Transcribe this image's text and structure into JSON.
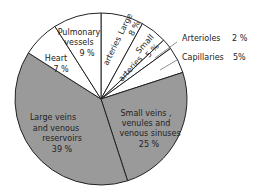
{
  "chart_data": {
    "type": "pie",
    "title": "",
    "start_angle_deg": 0,
    "direction": "clockwise",
    "categories": [
      "Large arteries",
      "Small arteries",
      "Arterioles",
      "Capillaries",
      "Small veins, venules and venous sinuses",
      "Large veins and venous reservoirs",
      "Heart",
      "Pulmonary vessels"
    ],
    "values": [
      8,
      5,
      2,
      5,
      25,
      39,
      7,
      9
    ],
    "value_labels": [
      "8 %",
      "5 %",
      "2 %",
      "5%",
      "25 %",
      "39 %",
      "7 %",
      "9 %"
    ],
    "fills": [
      "#ffffff",
      "#ffffff",
      "#ffffff",
      "#ffffff",
      "#9a9a9a",
      "#9a9a9a",
      "#ffffff",
      "#ffffff"
    ],
    "stroke": "#222222",
    "legend": "none (labels placed on/next to slices)",
    "grid": false
  },
  "labels": {
    "large_arteries": {
      "line1": "Large",
      "line2": "arteries",
      "pct": "8 %"
    },
    "small_arteries": {
      "line1": "Small",
      "line2": "arteries",
      "pct": "5 %"
    },
    "arterioles": {
      "name": "Arterioles",
      "pct": "2 %"
    },
    "capillaries": {
      "name": "Capillaries",
      "pct": "5%"
    },
    "small_veins": {
      "line1": "Small  veins ,",
      "line2": "venules  and",
      "line3": "venous  sinuses",
      "pct": "25 %"
    },
    "large_veins": {
      "line1": "Large  veins",
      "line2": "and  venous",
      "line3": "reservoirs",
      "pct": "39 %"
    },
    "heart": {
      "name": "Heart",
      "pct": "7 %"
    },
    "pulmonary": {
      "line1": "Pulmonary",
      "line2": "vessels",
      "pct": "9 %"
    }
  }
}
